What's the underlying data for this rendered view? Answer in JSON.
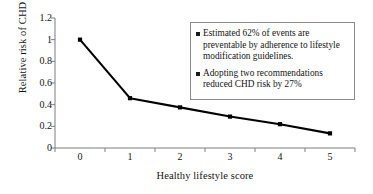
{
  "chart_data": {
    "type": "line",
    "title": "",
    "xlabel": "Healthy lifestyle score",
    "ylabel": "Relative risk of CHD",
    "x": [
      0,
      1,
      2,
      3,
      4,
      5
    ],
    "categories": [
      "0",
      "1",
      "2",
      "3",
      "4",
      "5"
    ],
    "values": [
      1.0,
      0.46,
      0.375,
      0.29,
      0.22,
      0.135
    ],
    "series": [
      {
        "name": "Relative risk of CHD",
        "values": [
          1.0,
          0.46,
          0.375,
          0.29,
          0.22,
          0.135
        ],
        "marker": "square",
        "color": "#000000"
      }
    ],
    "xlim": [
      -0.5,
      5.5
    ],
    "ylim": [
      0,
      1.2
    ],
    "yticks": [
      0,
      0.2,
      0.4,
      0.6,
      0.8,
      1,
      1.2
    ],
    "ytick_labels": [
      "0",
      "0.2",
      "0.4",
      "0.6",
      "0.8",
      "1",
      "1.2"
    ],
    "xticks": [
      0,
      1,
      2,
      3,
      4,
      5
    ],
    "xtick_labels": [
      "0",
      "1",
      "2",
      "3",
      "4",
      "5"
    ],
    "grid": false,
    "legend_position": "upper-right",
    "annotations": [
      "Estimated 62% of events are preventable by adherence to lifestyle modification guidelines.",
      "Adopting two recommendations reduced CHD risk by 27%"
    ]
  },
  "legend": {
    "items": [
      {
        "text": "Estimated 62% of events are preventable by adherence to lifestyle modification guidelines."
      },
      {
        "text": "Adopting two recommendations reduced CHD risk by 27%"
      }
    ]
  },
  "colors": {
    "line": "#000000",
    "marker": "#000000",
    "axis": "#7d7d7d",
    "legend_border": "#8d8d8d",
    "text": "#141414",
    "background": "#ffffff"
  }
}
